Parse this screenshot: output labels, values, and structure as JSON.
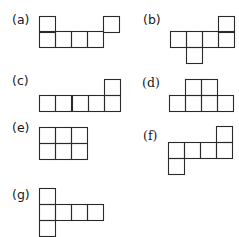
{
  "figures": [
    {
      "id": "a",
      "label": "(a)",
      "label_pos": [
        12,
        14
      ],
      "serif": false,
      "cells": [
        [
          39,
          16
        ],
        [
          103,
          16
        ],
        [
          39,
          31
        ],
        [
          55,
          31
        ],
        [
          71,
          31
        ],
        [
          87,
          31
        ]
      ]
    },
    {
      "id": "b",
      "label": "(b)",
      "label_pos": [
        143,
        14
      ],
      "serif": false,
      "cells": [
        [
          218,
          16
        ],
        [
          170,
          31
        ],
        [
          186,
          31
        ],
        [
          202,
          31
        ],
        [
          218,
          31
        ],
        [
          186,
          47
        ]
      ]
    },
    {
      "id": "c",
      "label": "(c)",
      "label_pos": [
        12,
        75
      ],
      "serif": false,
      "cells": [
        [
          104,
          79
        ],
        [
          39,
          95
        ],
        [
          55,
          95
        ],
        [
          72,
          95
        ],
        [
          88,
          95
        ],
        [
          104,
          95
        ]
      ]
    },
    {
      "id": "d",
      "label": "(d)",
      "label_pos": [
        142,
        77
      ],
      "serif": true,
      "cells": [
        [
          185,
          79
        ],
        [
          201,
          79
        ],
        [
          169,
          95
        ],
        [
          185,
          95
        ],
        [
          201,
          95
        ],
        [
          217,
          95
        ]
      ]
    },
    {
      "id": "e",
      "label": "(e)",
      "label_pos": [
        12,
        122
      ],
      "serif": false,
      "cells": [
        [
          39,
          127
        ],
        [
          55,
          127
        ],
        [
          71,
          127
        ],
        [
          39,
          143
        ],
        [
          55,
          143
        ],
        [
          71,
          143
        ]
      ]
    },
    {
      "id": "f",
      "label": "(f)",
      "label_pos": [
        143,
        130
      ],
      "serif": true,
      "cells": [
        [
          216,
          126
        ],
        [
          168,
          142
        ],
        [
          184,
          142
        ],
        [
          200,
          142
        ],
        [
          216,
          142
        ],
        [
          168,
          158
        ]
      ]
    },
    {
      "id": "g",
      "label": "(g)",
      "label_pos": [
        12,
        189
      ],
      "serif": false,
      "cells": [
        [
          39,
          188
        ],
        [
          39,
          204
        ],
        [
          55,
          204
        ],
        [
          71,
          204
        ],
        [
          87,
          204
        ],
        [
          39,
          220
        ]
      ]
    }
  ],
  "cell_size": 16,
  "stroke_color": "#2a2a2a"
}
